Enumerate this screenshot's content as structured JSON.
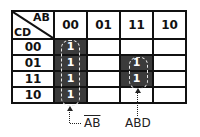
{
  "kmap": {
    "corner": {
      "col_var": "AB",
      "row_var": "CD"
    },
    "columns": [
      "00",
      "01",
      "11",
      "10"
    ],
    "rows": [
      {
        "label": "00",
        "cells": [
          "1",
          "",
          "",
          ""
        ]
      },
      {
        "label": "01",
        "cells": [
          "1",
          "",
          "1",
          ""
        ]
      },
      {
        "label": "11",
        "cells": [
          "1",
          "",
          "1",
          ""
        ]
      },
      {
        "label": "10",
        "cells": [
          "1",
          "",
          "",
          ""
        ]
      }
    ],
    "fill_color": "#3b3b3b"
  },
  "groups": [
    {
      "term": "AB",
      "overline": true,
      "cells": "column 00, all rows"
    },
    {
      "term": "ABD",
      "overline": false,
      "cells": "column 11, rows 01 and 11"
    }
  ]
}
